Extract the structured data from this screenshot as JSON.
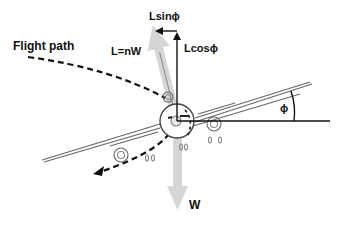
{
  "diagram": {
    "labels": {
      "flight_path": "Flight path",
      "lift": "L=nW",
      "lift_horizontal": "Lsinϕ",
      "lift_vertical": "Lcosϕ",
      "weight": "W",
      "bank_angle": "ϕ"
    },
    "colors": {
      "force_arrow": "#d4d4d4",
      "line": "#111111",
      "aircraft_outline": "#555555",
      "background": "#ffffff"
    },
    "elements": [
      {
        "id": "flight-path",
        "type": "dashed-curve-arrow",
        "label_ref": "flight_path"
      },
      {
        "id": "lift-vector",
        "type": "gray-arrow",
        "direction": "up-left",
        "label_ref": "lift"
      },
      {
        "id": "lift-horizontal-component",
        "type": "arrow",
        "direction": "left",
        "label_ref": "lift_horizontal"
      },
      {
        "id": "lift-vertical-component",
        "type": "arrow",
        "direction": "up",
        "label_ref": "lift_vertical"
      },
      {
        "id": "weight-vector",
        "type": "gray-arrow",
        "direction": "down",
        "label_ref": "weight"
      },
      {
        "id": "bank-angle-arc",
        "type": "angle-arc",
        "label_ref": "bank_angle"
      },
      {
        "id": "aircraft",
        "type": "banked-aircraft-front-view"
      }
    ]
  }
}
